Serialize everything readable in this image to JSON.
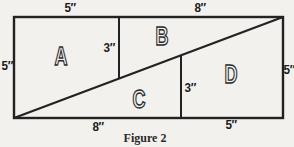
{
  "figure": {
    "caption": "Figure 2",
    "regions": [
      {
        "label": "A"
      },
      {
        "label": "B"
      },
      {
        "label": "C"
      },
      {
        "label": "D"
      }
    ],
    "measurements": {
      "top_left": "5″",
      "top_right": "8″",
      "left_side": "5″",
      "right_side": "5″",
      "inner_upper": "3″",
      "inner_lower": "3″",
      "bottom_left": "8″",
      "bottom_right": "5″"
    },
    "colors": {
      "line": "#222222",
      "background": "#f2f1ed",
      "ink": "#1c1c1c"
    }
  }
}
